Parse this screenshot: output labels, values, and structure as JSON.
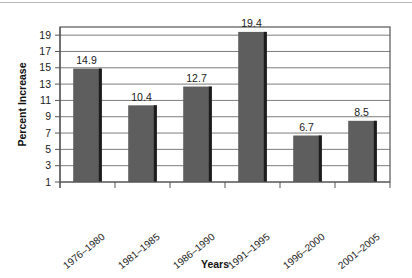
{
  "chart_data": {
    "type": "bar",
    "title": "",
    "xlabel": "Years",
    "ylabel": "Percent Increase",
    "categories": [
      "1976–1980",
      "1981–1985",
      "1986–1990",
      "1991–1995",
      "1996–2000",
      "2001–2005"
    ],
    "values": [
      14.9,
      10.4,
      12.7,
      19.4,
      6.7,
      8.5
    ],
    "value_labels": [
      "14.9",
      "10.4",
      "12.7",
      "19.4",
      "6.7",
      "8.5"
    ],
    "ylim": [
      1,
      20
    ],
    "yticks": [
      1,
      3,
      5,
      7,
      9,
      11,
      13,
      15,
      17,
      19
    ],
    "ytick_labels": [
      "1",
      "3",
      "5",
      "7",
      "9",
      "11",
      "13",
      "15",
      "17",
      "19"
    ],
    "grid": true,
    "legend": "none",
    "bar_color": "#5e5e5e",
    "bar_edge_color": "#1c1c1c",
    "grid_color": "#7d7d7d",
    "axis_color": "#555555",
    "background": "#ffffff"
  }
}
